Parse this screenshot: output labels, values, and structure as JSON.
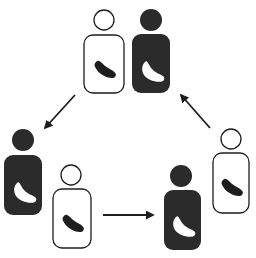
{
  "diagram": {
    "title": "",
    "type": "cycle",
    "colors": {
      "background": "#ffffff",
      "dark": "#2b2b2b",
      "stroke": "#1e1e1e",
      "light": "#ffffff"
    },
    "groups": [
      {
        "id": "top",
        "figures": [
          {
            "id": "top-white",
            "fill": "light",
            "head": {
              "cx": 104,
              "cy": 20,
              "r": 10
            },
            "body": {
              "x": 84,
              "y": 35,
              "w": 40,
              "h": 58
            }
          },
          {
            "id": "top-dark",
            "fill": "dark",
            "head": {
              "cx": 151,
              "cy": 20,
              "r": 11
            },
            "body": {
              "x": 132,
              "y": 34,
              "w": 38,
              "h": 59
            }
          }
        ]
      },
      {
        "id": "bottom-left",
        "figures": [
          {
            "id": "left-dark",
            "fill": "dark",
            "head": {
              "cx": 23,
              "cy": 140,
              "r": 11
            },
            "body": {
              "x": 4,
              "y": 155,
              "w": 38,
              "h": 60
            }
          },
          {
            "id": "bottom-left-white",
            "fill": "light",
            "head": {
              "cx": 71,
              "cy": 175,
              "r": 10
            },
            "body": {
              "x": 53,
              "y": 189,
              "w": 38,
              "h": 59
            }
          }
        ]
      },
      {
        "id": "bottom-right",
        "figures": [
          {
            "id": "bottom-right-dark",
            "fill": "dark",
            "head": {
              "cx": 181,
              "cy": 176,
              "r": 11
            },
            "body": {
              "x": 164,
              "y": 190,
              "w": 37,
              "h": 60
            }
          },
          {
            "id": "right-white",
            "fill": "light",
            "head": {
              "cx": 231,
              "cy": 139,
              "r": 10
            },
            "body": {
              "x": 213,
              "y": 153,
              "w": 36,
              "h": 60
            }
          }
        ]
      }
    ],
    "arrows": [
      {
        "id": "arrow-top-to-left",
        "from": [
          75,
          95
        ],
        "to": [
          45,
          128
        ]
      },
      {
        "id": "arrow-left-to-right",
        "from": [
          103,
          215
        ],
        "to": [
          153,
          215
        ]
      },
      {
        "id": "arrow-right-to-top",
        "from": [
          210,
          128
        ],
        "to": [
          181,
          95
        ]
      }
    ]
  }
}
